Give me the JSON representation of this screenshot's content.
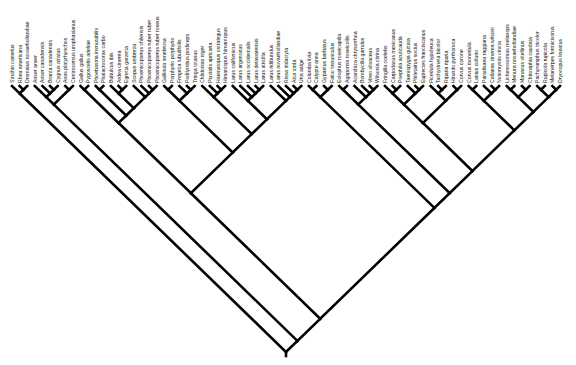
{
  "diagram": {
    "type": "cladogram",
    "orientation": "tips-up",
    "line_color": "#000000",
    "root": {
      "x": 282,
      "y": 352
    },
    "tip_y": 86,
    "tip_x_start": 12,
    "tip_x_end": 560
  },
  "taxa": [
    "Struthio camelus",
    "Rhea americana",
    "Dromaius novaehollandiae",
    "Anser anser",
    "Anser canadensis",
    "Branta canadensis",
    "Cygnus atratus",
    "Anas platyrhynchos",
    "Centrocercus urophasianus",
    "Gallus gallus",
    "Pygoscelis adeliae",
    "Phoebastria immutabilis",
    "Phalacrocorax carbo",
    "Bubulcus ibis",
    "Ardea cinerea",
    "Egretta garzetta",
    "Scopus umbretta",
    "Phoenicopterus chilensis",
    "Phoenicopterus ruber ruber",
    "Phoenicopterus ruber roseus",
    "Gallinula tenebrosa",
    "Porphyrio porphyrio",
    "Fregetta tubulifoilis",
    "Podilymbus podiceps",
    "Tringa totanus",
    "Chlidonias niger",
    "Pluvialis apricaria",
    "Haematopus ostralegus",
    "Himantopus himantopus",
    "Larus californicus",
    "Larus argentatus",
    "Larus occidentalis",
    "Larus delawarensis",
    "Larus atricilla",
    "Larus ridibundus",
    "Larus novaehollandiae",
    "Rissa tridactyla",
    "Alca torda",
    "Uria aalge",
    "Columba livia",
    "Calypte anna",
    "Gypaetus barbatus",
    "Falco tinnunculus",
    "Eolophus roseicapilla",
    "Agapornis roseicollis",
    "Acanthiza chrysorrhoa",
    "Bombycilla garrulus",
    "Vireo olivaceus",
    "Wilsonia citrina",
    "Fringilla coelebs",
    "Carpodacus mexicanus",
    "Poephila acuticauda",
    "Taeniopygia guttata",
    "Philetairus socius",
    "Euplectes franciscanus",
    "Ficedula hypoleuca",
    "Tachycineta bicolor",
    "Riparia riparia",
    "Hirundo pyrrhonota",
    "Corvus corone",
    "Corvus monedula",
    "Lanius collurio",
    "Paradisaea raggiana",
    "Callaeas cinerea wilsoni",
    "Notiomystis cincta",
    "Lichenostomus melanops",
    "Menura novaehollandiae",
    "Manacus vitellinus",
    "Chiroxiphia caudata",
    "Pachyramphus tricolor",
    "Rupicola rupicola",
    "Melanerpes formicivorus",
    "Dryocopus lineatus"
  ],
  "newick": "((0,(1,2)),(((3,(4,(5,6))),(7,8)),((((9,10),((11,12),((13,(14,15)),(16,(17,(18,19)))))),(((20,21),(22,(23,24))),((25,(26,(27,28))),((29,(30,(31,(32,33)))),(34,(35,(36,(37,38)))))))),(((39,40),(41,42)),(((43,44),(45,(46,(47,48)))),((((49,(50,51)),(52,(53,54))),((55,(56,57)),(58,59))),(((60,61),(62,(63,64))),(((65,66),(67,68)),((69,70),(71,72))))))))))"
}
